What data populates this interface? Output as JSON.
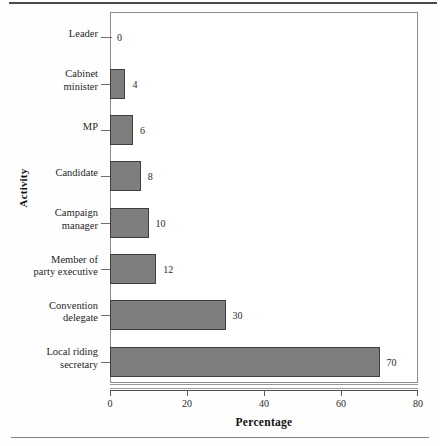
{
  "chart_data": {
    "type": "bar",
    "orientation": "horizontal",
    "title": "",
    "xlabel": "Percentage",
    "ylabel": "Activity",
    "categories": [
      "Leader",
      "Cabinet\nminister",
      "MP",
      "Candidate",
      "Campaign\nmanager",
      "Member of\nparty executive",
      "Convention\ndelegate",
      "Local riding\nsecretary"
    ],
    "values": [
      0,
      4,
      6,
      8,
      10,
      12,
      30,
      70
    ],
    "data_labels": [
      "0",
      "4",
      "6",
      "8",
      "10",
      "12",
      "30",
      "70"
    ],
    "xlim": [
      0,
      80
    ],
    "xticks": [
      0,
      20,
      40,
      60,
      80
    ],
    "xticklabels": [
      "0",
      "20",
      "40",
      "60",
      "80"
    ],
    "grid": false,
    "legend": null,
    "bar_color": "#7e7e7e",
    "bar_edge_color": "#3f3f3f",
    "axis_color": "#8d8d8d",
    "text_color": "#1f1f1f"
  }
}
